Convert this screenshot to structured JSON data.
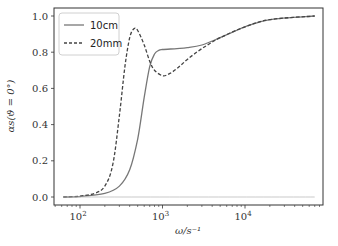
{
  "chart_data": {
    "type": "line",
    "title": "",
    "xlabel": "ω/s⁻¹",
    "ylabel": "αs(ϑ = 0°)",
    "xscale": "log",
    "xlim": [
      55,
      90000
    ],
    "ylim": [
      -0.05,
      1.05
    ],
    "x_ticks": [
      "10²",
      "10³",
      "10⁴"
    ],
    "y_ticks": [
      "0.0",
      "0.2",
      "0.4",
      "0.6",
      "0.8",
      "1.0"
    ],
    "grid": false,
    "legend_position": "upper left",
    "series": [
      {
        "name": "10cm",
        "style": "solid",
        "color": "#777777",
        "x": [
          63,
          100,
          200,
          300,
          400,
          500,
          600,
          700,
          800,
          900,
          1000,
          1500,
          2000,
          3000,
          5000,
          10000,
          20000,
          70000
        ],
        "y": [
          0.0,
          0.002,
          0.02,
          0.06,
          0.15,
          0.32,
          0.55,
          0.72,
          0.79,
          0.81,
          0.815,
          0.82,
          0.825,
          0.84,
          0.88,
          0.94,
          0.98,
          1.0
        ]
      },
      {
        "name": "20mm",
        "style": "dashed",
        "color": "#444444",
        "x": [
          63,
          100,
          150,
          200,
          250,
          300,
          350,
          400,
          450,
          500,
          600,
          700,
          800,
          1000,
          1200,
          1500,
          2000,
          3000,
          5000,
          10000,
          20000,
          70000
        ],
        "y": [
          0.0,
          0.005,
          0.02,
          0.06,
          0.18,
          0.45,
          0.72,
          0.88,
          0.93,
          0.92,
          0.84,
          0.75,
          0.7,
          0.67,
          0.68,
          0.71,
          0.76,
          0.82,
          0.88,
          0.94,
          0.98,
          1.0
        ]
      },
      {
        "name": "baseline",
        "style": "solid-thin",
        "color": "#bbbbbb",
        "x": [
          63,
          70000
        ],
        "y": [
          0.0,
          0.0
        ]
      }
    ]
  },
  "legend": {
    "items": [
      {
        "label": "10cm",
        "style": "solid"
      },
      {
        "label": "20mm",
        "style": "dashed"
      }
    ]
  },
  "axes": {
    "xlabel": "ω/s⁻¹",
    "ylabel": "αs(ϑ = 0°)",
    "y_ticks": [
      "0.0",
      "0.2",
      "0.4",
      "0.6",
      "0.8",
      "1.0"
    ],
    "x_ticks": [
      {
        "base": "10",
        "exp": "2"
      },
      {
        "base": "10",
        "exp": "3"
      },
      {
        "base": "10",
        "exp": "4"
      }
    ]
  }
}
